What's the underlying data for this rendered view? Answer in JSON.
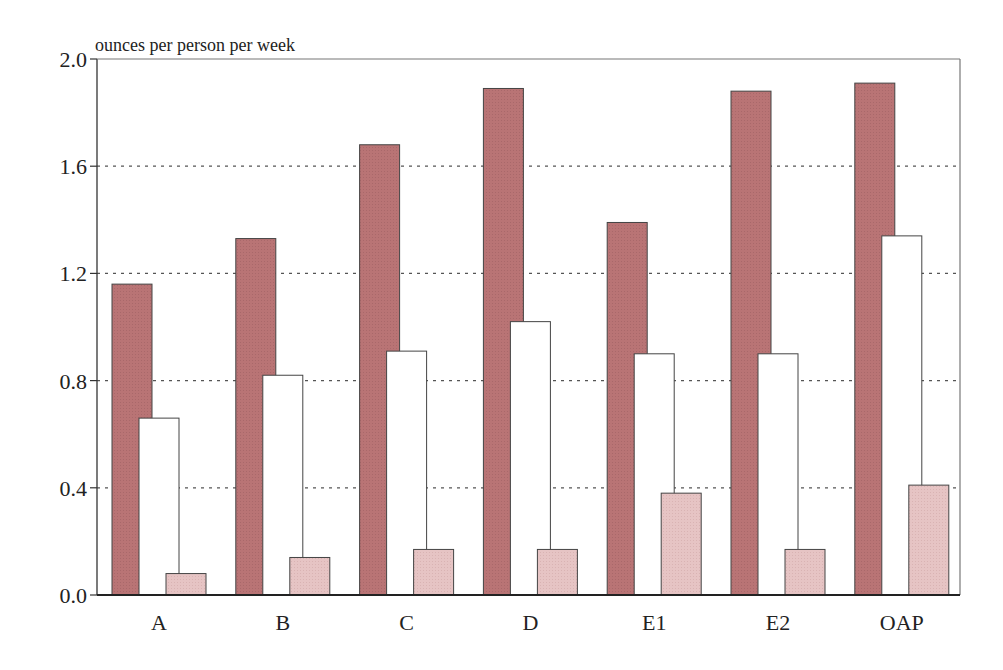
{
  "chart_data": {
    "type": "bar",
    "title": "",
    "ylabel": "ounces per person per week",
    "xlabel": "",
    "ylim": [
      0,
      2.0
    ],
    "yticks": [
      "0.0",
      "0.4",
      "0.8",
      "1.2",
      "1.6",
      "2.0"
    ],
    "grid": "horizontal dotted",
    "legend": "none",
    "categories": [
      "A",
      "B",
      "C",
      "D",
      "E1",
      "E2",
      "OAP"
    ],
    "series": [
      {
        "name": "series-1 (dark)",
        "color": "#b97475",
        "values": [
          1.16,
          1.33,
          1.68,
          1.89,
          1.39,
          1.88,
          1.91
        ]
      },
      {
        "name": "series-2 (white)",
        "color": "#ffffff",
        "values": [
          0.66,
          0.82,
          0.91,
          1.02,
          0.9,
          0.9,
          1.34
        ]
      },
      {
        "name": "series-3 (light)",
        "color": "#e6c4c4",
        "values": [
          0.08,
          0.14,
          0.17,
          0.17,
          0.38,
          0.17,
          0.41
        ]
      }
    ]
  },
  "colors": {
    "axis": "#333333",
    "grid": "#555555",
    "bar_stroke": "#444444"
  }
}
